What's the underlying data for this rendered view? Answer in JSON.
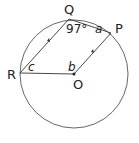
{
  "diagram": {
    "points": {
      "Q": {
        "label": "Q",
        "x": 69,
        "y": 19
      },
      "P": {
        "label": "P",
        "x": 111,
        "y": 33
      },
      "R": {
        "label": "R",
        "x": 20,
        "y": 73
      },
      "O": {
        "label": "O",
        "x": 74,
        "y": 74
      }
    },
    "circle": {
      "cx": 74,
      "cy": 74,
      "r": 54
    },
    "angles": {
      "Q": "97°",
      "P": "a",
      "O": "b",
      "R": "c"
    },
    "colors": {
      "stroke": "#333333",
      "text": "#222222"
    }
  }
}
